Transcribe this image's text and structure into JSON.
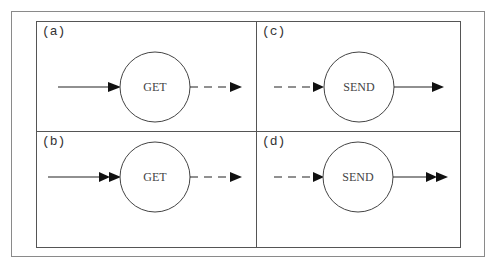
{
  "panels": [
    {
      "id": "a",
      "label": "(a)",
      "node": "GET",
      "input": "solid-single",
      "output": "dashed-single"
    },
    {
      "id": "b",
      "label": "(b)",
      "node": "GET",
      "input": "solid-double",
      "output": "dashed-single"
    },
    {
      "id": "c",
      "label": "(c)",
      "node": "SEND",
      "input": "dashed-single",
      "output": "solid-single"
    },
    {
      "id": "d",
      "label": "(d)",
      "node": "SEND",
      "input": "dashed-single",
      "output": "solid-double"
    }
  ],
  "colors": {
    "line": "#222222",
    "border": "#555555",
    "text": "#444444"
  }
}
